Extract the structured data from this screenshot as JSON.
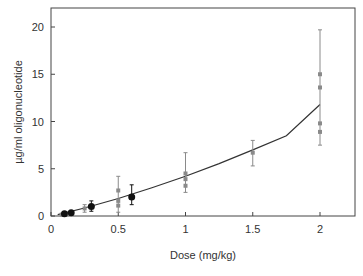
{
  "chart_data": {
    "type": "scatter",
    "title": "",
    "xlabel": "Dose (mg/kg)",
    "ylabel": "µg/ml oligonucleotide",
    "xlim": [
      0,
      2.25
    ],
    "ylim": [
      0,
      22
    ],
    "xticks": [
      0,
      0.5,
      1,
      1.5,
      2
    ],
    "xtick_labels": [
      "0",
      "0.5",
      "1",
      "1.5",
      "2"
    ],
    "yticks": [
      0,
      5,
      10,
      15,
      20
    ],
    "ytick_labels": [
      "0",
      "5",
      "10",
      "15",
      "20"
    ],
    "grid": false,
    "legend": null,
    "series": [
      {
        "name": "gray-points",
        "marker": "square",
        "color": "#8a8a8a",
        "points": [
          {
            "x": 0.08,
            "y": 0.15
          },
          {
            "x": 0.15,
            "y": 0.35
          },
          {
            "x": 0.25,
            "y": 0.8,
            "err_low": 0.4,
            "err_high": 1.2
          },
          {
            "x": 0.5,
            "y": 2.7,
            "err_low": 0.4,
            "err_high": 4.2
          },
          {
            "x": 0.5,
            "y": 1.6
          },
          {
            "x": 0.5,
            "y": 1.1
          },
          {
            "x": 1.0,
            "y": 4.5,
            "err_low": 2.5,
            "err_high": 6.7
          },
          {
            "x": 1.0,
            "y": 3.9
          },
          {
            "x": 1.0,
            "y": 3.2
          },
          {
            "x": 1.5,
            "y": 6.7,
            "err_low": 5.3,
            "err_high": 8.0
          },
          {
            "x": 2.0,
            "y": 15.0,
            "err_low": 7.5,
            "err_high": 19.7
          },
          {
            "x": 2.0,
            "y": 13.6
          },
          {
            "x": 2.0,
            "y": 9.8
          },
          {
            "x": 2.0,
            "y": 8.9
          }
        ]
      },
      {
        "name": "black-points",
        "marker": "circle",
        "color": "#111111",
        "points": [
          {
            "x": 0.1,
            "y": 0.25
          },
          {
            "x": 0.15,
            "y": 0.35
          },
          {
            "x": 0.3,
            "y": 1.0,
            "err_low": 0.5,
            "err_high": 1.6
          },
          {
            "x": 0.6,
            "y": 2.0,
            "err_low": 1.2,
            "err_high": 3.3
          }
        ]
      }
    ],
    "fit_curve": {
      "type": "line",
      "color": "#333333",
      "x": [
        0.05,
        0.25,
        0.5,
        0.75,
        1.0,
        1.25,
        1.5,
        1.75,
        2.0
      ],
      "y": [
        0.15,
        0.85,
        1.85,
        3.0,
        4.2,
        5.55,
        7.0,
        8.5,
        11.8
      ]
    }
  },
  "axes": {
    "xlabel": "Dose (mg/kg)",
    "ylabel": "µg/ml oligonucleotide"
  }
}
